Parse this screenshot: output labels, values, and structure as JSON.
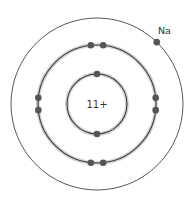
{
  "diagram": {
    "element_symbol": "Na",
    "nucleus_charge_label": "11+",
    "shells": [
      {
        "name": "first",
        "electron_count": 2,
        "electron_angles_deg": [
          90,
          270
        ]
      },
      {
        "name": "second",
        "electron_count": 8,
        "electron_angles_deg": [
          84,
          96,
          174,
          186,
          264,
          276,
          354,
          6
        ]
      },
      {
        "name": "third",
        "electron_count": 1,
        "electron_angles_deg": [
          46
        ]
      }
    ],
    "colors": {
      "shell_stroke": "#3a3a3a",
      "shell_halo": "#d6d6d6",
      "electron": "#555555",
      "text": "#333333"
    }
  }
}
